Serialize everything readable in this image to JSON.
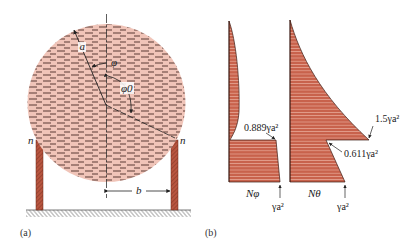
{
  "figure": {
    "panel_a": {
      "caption": "(a)",
      "labels": {
        "radius": "a",
        "angle_phi": "φ",
        "angle_phi0": "φ0",
        "support_left": "n",
        "support_right": "n",
        "half_span": "b"
      }
    },
    "panel_b": {
      "caption": "(b)",
      "diagram_left": {
        "axis_label": "Nφ",
        "annotation_top": "0.889γa²",
        "annotation_bottom": "γa²"
      },
      "diagram_right": {
        "axis_label": "Nθ",
        "annotation_peak": "1.5γa²",
        "annotation_notch": "0.611γa²",
        "annotation_bottom": "γa²"
      }
    },
    "colors": {
      "fluid_fill": "#f0c4b8",
      "fluid_dash": "#5a3a34",
      "diagram_fill": "#c8624c",
      "leg_fill": "#b8553f",
      "line": "#222222"
    }
  }
}
